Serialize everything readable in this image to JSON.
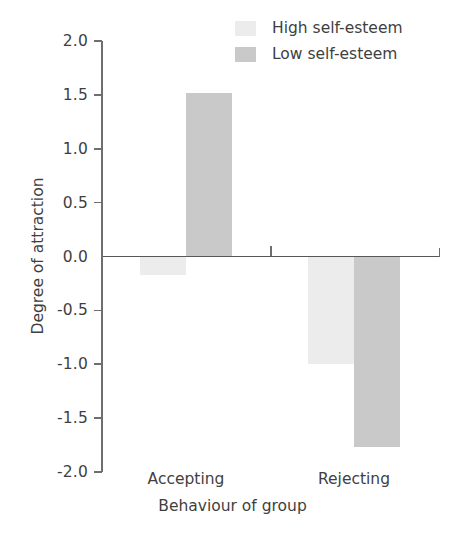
{
  "chart_data": {
    "type": "bar",
    "title": "",
    "xlabel": "Behaviour of group",
    "ylabel": "Degree of attraction",
    "categories": [
      "Accepting",
      "Rejecting"
    ],
    "series": [
      {
        "name": "High self-esteem",
        "color": "#ececec",
        "values": [
          -0.17,
          -1.0
        ]
      },
      {
        "name": "Low self-esteem",
        "color": "#c9c9c9",
        "values": [
          1.52,
          -1.77
        ]
      }
    ],
    "ylim": [
      -2.0,
      2.0
    ],
    "ytick_labels": [
      "2.0",
      "1.5",
      "1.0",
      "0.5",
      "0.0",
      "-0.5",
      "-1.0",
      "-1.5",
      "-2.0"
    ],
    "ytick_values": [
      2.0,
      1.5,
      1.0,
      0.5,
      0.0,
      -0.5,
      -1.0,
      -1.5,
      -2.0
    ],
    "grid": false,
    "legend_position": "top-right"
  },
  "legend": {
    "entries": [
      {
        "label": "High self-esteem"
      },
      {
        "label": "Low self-esteem"
      }
    ]
  },
  "axes": {
    "y_label": "Degree of attraction",
    "x_label": "Behaviour of group",
    "y_ticks": [
      {
        "label": "2.0"
      },
      {
        "label": "1.5"
      },
      {
        "label": "1.0"
      },
      {
        "label": "0.5"
      },
      {
        "label": "0.0"
      },
      {
        "label": "-0.5"
      },
      {
        "label": "-1.0"
      },
      {
        "label": "-1.5"
      },
      {
        "label": "-2.0"
      }
    ],
    "x_ticks": [
      {
        "label": "Accepting"
      },
      {
        "label": "Rejecting"
      }
    ]
  }
}
